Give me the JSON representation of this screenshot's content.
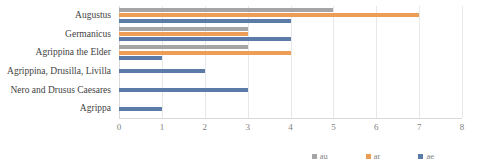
{
  "chart_data": {
    "type": "bar",
    "orientation": "horizontal",
    "title": "",
    "xlabel": "",
    "ylabel": "",
    "xlim": [
      0,
      8
    ],
    "xticks": [
      0,
      1,
      2,
      3,
      4,
      5,
      6,
      7,
      8
    ],
    "grid": true,
    "legend_position": "bottom",
    "categories": [
      "Augustus",
      "Germanicus",
      "Agrippina the Elder",
      "Agrippina, Drusilla, Livilla",
      "Nero and Drusus Caesares",
      "Agrippa"
    ],
    "series": [
      {
        "name": "au",
        "color": "#a5a5a5",
        "values": [
          5,
          3,
          3,
          0,
          0,
          0
        ]
      },
      {
        "name": "ar",
        "color": "#ed9d56",
        "values": [
          7,
          3,
          4,
          0,
          0,
          0
        ]
      },
      {
        "name": "ae",
        "color": "#5b7ca8",
        "values": [
          4,
          4,
          1,
          2,
          3,
          1
        ]
      }
    ]
  },
  "legend": {
    "items": [
      {
        "label": "au",
        "color": "#a5a5a5"
      },
      {
        "label": "ar",
        "color": "#ed9d56"
      },
      {
        "label": "ae",
        "color": "#5b7ca8"
      }
    ]
  },
  "axis": {
    "tick_labels": [
      "0",
      "1",
      "2",
      "3",
      "4",
      "5",
      "6",
      "7",
      "8"
    ]
  }
}
